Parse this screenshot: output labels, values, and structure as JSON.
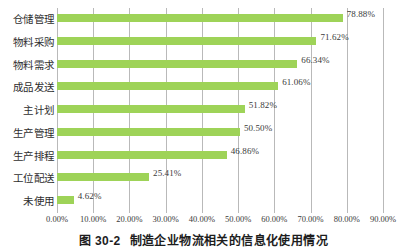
{
  "caption": {
    "number": "图 30-2",
    "text": "制造企业物流相关的信息化使用情况"
  },
  "colors": {
    "bar": "#9ed358",
    "gridline": "#b9b9b9",
    "text": "#2e2e2e",
    "background": "#ffffff"
  },
  "chart_data": {
    "type": "bar",
    "orientation": "horizontal",
    "title": "制造企业物流相关的信息化使用情况",
    "xlabel": "",
    "ylabel": "",
    "xlim": [
      0,
      90
    ],
    "xtick_labels": [
      "0.00%",
      "10.00%",
      "20.00%",
      "30.00%",
      "40.00%",
      "50.00%",
      "60.00%",
      "70.00%",
      "80.00%",
      "90.00%"
    ],
    "xtick_values": [
      0,
      10,
      20,
      30,
      40,
      50,
      60,
      70,
      80,
      90
    ],
    "grid": true,
    "legend": "none",
    "categories": [
      "仓储管理",
      "物料采购",
      "物料需求",
      "成品发送",
      "主计划",
      "生产管理",
      "生产排程",
      "工位配送",
      "未使用"
    ],
    "values": [
      78.88,
      71.62,
      66.34,
      61.06,
      51.82,
      50.5,
      46.86,
      25.41,
      4.62
    ],
    "value_labels": [
      "78.88%",
      "71.62%",
      "66.34%",
      "61.06%",
      "51.82%",
      "50.50%",
      "46.86%",
      "25.41%",
      "4.62%"
    ]
  }
}
